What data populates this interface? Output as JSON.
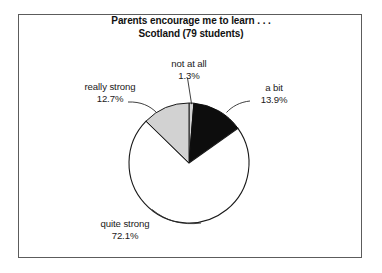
{
  "figure": {
    "title_line1": "Parents encourage me to learn . . .",
    "title_line2": "Scotland (79 students)",
    "border_color": "#5c5c5c",
    "background": "#ffffff"
  },
  "chart_data": {
    "type": "pie",
    "title": "Parents encourage me to learn . . . Scotland (79 students)",
    "subtitle": "Scotland (79 students)",
    "sample_size": 79,
    "region": "Scotland",
    "units": "percent",
    "start_angle_deg": 0,
    "direction": "clockwise",
    "legend": "none",
    "labels": [
      "not at all",
      "a bit",
      "quite strong",
      "really strong"
    ],
    "values": [
      1.3,
      13.9,
      72.1,
      12.7
    ],
    "value_labels": [
      "1.3%",
      "13.9%",
      "72.1%",
      "12.7%"
    ],
    "colors": [
      "#d2d2d2",
      "#0d0d0d",
      "#ffffff",
      "#d2d2d2"
    ],
    "slices": [
      {
        "label": "not at all",
        "value": 1.3,
        "value_label": "1.3%",
        "color": "#d2d2d2",
        "order": 1
      },
      {
        "label": "a bit",
        "value": 13.9,
        "value_label": "13.9%",
        "color": "#0d0d0d",
        "order": 2
      },
      {
        "label": "quite strong",
        "value": 72.1,
        "value_label": "72.1%",
        "color": "#ffffff",
        "order": 3
      },
      {
        "label": "really strong",
        "value": 12.7,
        "value_label": "12.7%",
        "color": "#d2d2d2",
        "order": 4
      }
    ]
  }
}
